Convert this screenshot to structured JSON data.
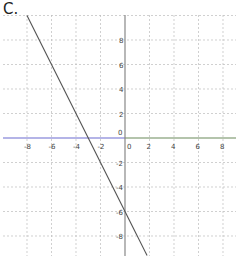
{
  "panel_label": "C.",
  "chart_data": {
    "type": "line",
    "title": "",
    "xlabel": "",
    "ylabel": "",
    "xlim": [
      -9.8,
      9
    ],
    "ylim": [
      -9.5,
      10
    ],
    "grid": true,
    "x_ticks": [
      -8,
      -6,
      -4,
      -2,
      0,
      2,
      4,
      6,
      8
    ],
    "y_ticks": [
      8,
      6,
      4,
      2,
      0,
      -2,
      -4,
      -6,
      -8
    ],
    "x_tick_labels": [
      "-8",
      "-6",
      "-4",
      "-2",
      "0",
      "2",
      "4",
      "6",
      "8"
    ],
    "y_tick_labels": [
      "8",
      "6",
      "4",
      "2",
      "0",
      "-2",
      "-4",
      "-6",
      "-8"
    ],
    "series": [
      {
        "name": "y = -2x - 6",
        "x": [
          -8,
          -3,
          0,
          1.8
        ],
        "y": [
          10,
          0,
          -6,
          -9.6
        ],
        "color": "#555555"
      }
    ],
    "colors": {
      "x_axis_left": "#6a6ad0",
      "x_axis_right": "#6a8a5a",
      "y_axis": "#888888",
      "grid": "#bbbbbb"
    }
  }
}
